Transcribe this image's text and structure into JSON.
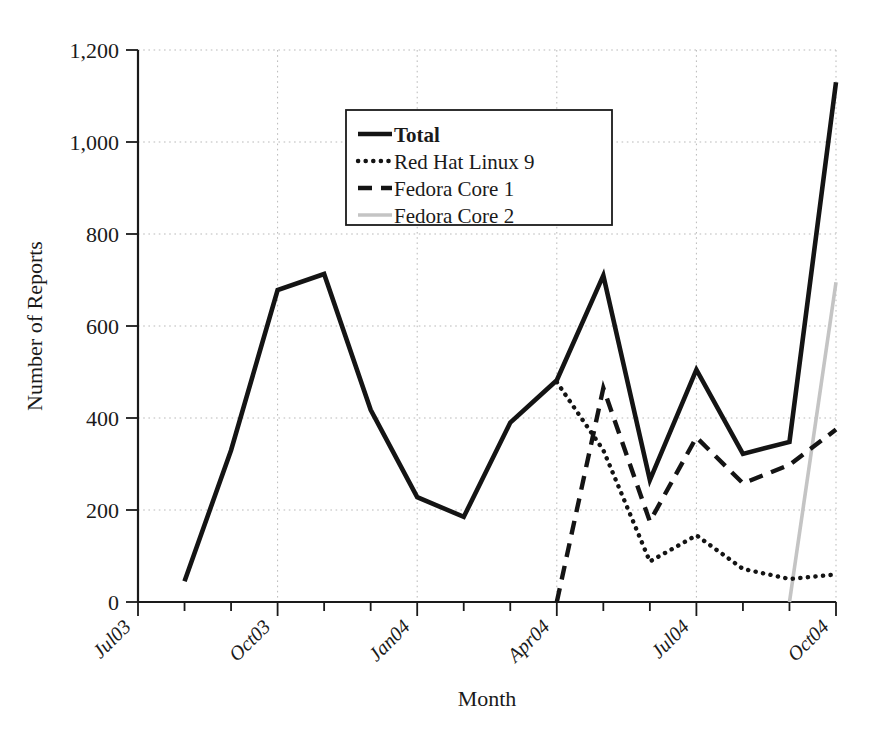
{
  "chart_data": {
    "type": "line",
    "title": "",
    "xlabel": "Month",
    "ylabel": "Number of Reports",
    "ylim": [
      0,
      1200
    ],
    "yticks": [
      "0",
      "200",
      "400",
      "600",
      "800",
      "1,000",
      "1,200"
    ],
    "ytick_values": [
      0,
      200,
      400,
      600,
      800,
      1000,
      1200
    ],
    "grid": true,
    "grid_axis": "both",
    "legend_position": "upper-center-left",
    "x": [
      "Jul03",
      "Aug03",
      "Sep03",
      "Oct03",
      "Nov03",
      "Dec03",
      "Jan04",
      "Feb04",
      "Mar04",
      "Apr04",
      "May04",
      "Jun04",
      "Jul04",
      "Aug04",
      "Sep04",
      "Oct04"
    ],
    "xtick_labels_shown": [
      "Jul03",
      "Oct03",
      "Jan04",
      "Apr04",
      "Jul04",
      "Oct04"
    ],
    "xtick_label_rotation_deg": 45,
    "series": [
      {
        "name": "Total",
        "style": "solid-bold",
        "color": "#141414",
        "values": [
          null,
          45,
          330,
          678,
          713,
          418,
          228,
          185,
          390,
          482,
          710,
          265,
          505,
          322,
          348,
          1130
        ]
      },
      {
        "name": "Red Hat Linux 9",
        "style": "dotted",
        "color": "#141414",
        "values": [
          null,
          null,
          null,
          null,
          null,
          null,
          null,
          null,
          null,
          478,
          330,
          88,
          145,
          72,
          50,
          60
        ]
      },
      {
        "name": "Fedora Core 1",
        "style": "dashed",
        "color": "#141414",
        "values": [
          null,
          null,
          null,
          null,
          null,
          null,
          null,
          null,
          null,
          0,
          465,
          175,
          358,
          258,
          298,
          375
        ]
      },
      {
        "name": "Fedora Core 2",
        "style": "solid-light",
        "color": "#c4c4c4",
        "values": [
          null,
          null,
          null,
          null,
          null,
          null,
          null,
          null,
          null,
          null,
          null,
          null,
          null,
          null,
          0,
          695
        ]
      }
    ]
  },
  "axes": {
    "y_axis_title": "Number of Reports",
    "x_axis_title": "Month",
    "y_tick_labels": [
      "1,200",
      "1,000",
      "800",
      "600",
      "400",
      "200",
      "0"
    ],
    "x_tick_labels": [
      "Jul03",
      "Oct03",
      "Jan04",
      "Apr04",
      "Jul04",
      "Oct04"
    ]
  },
  "legend": {
    "entries": [
      {
        "label": "Total",
        "style": "solid-bold"
      },
      {
        "label": "Red Hat Linux 9",
        "style": "dotted"
      },
      {
        "label": "Fedora Core 1",
        "style": "dashed"
      },
      {
        "label": "Fedora Core 2",
        "style": "solid-light"
      }
    ]
  },
  "colors": {
    "foreground": "#141414",
    "grid": "#b9b9b9",
    "fedora_core_2": "#c4c4c4",
    "background": "#ffffff"
  }
}
